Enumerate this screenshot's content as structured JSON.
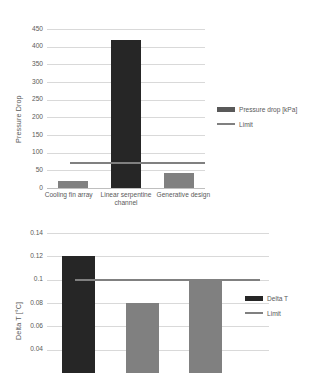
{
  "chart_data": [
    {
      "type": "bar",
      "id": "pressure-drop",
      "title": "",
      "xlabel": "",
      "ylabel": "Pressure Drop",
      "categories": [
        "Cooling fin array",
        "Linear serpentine channel",
        "Generative design"
      ],
      "series": [
        {
          "name": "Pressure drop [kPa]",
          "values": [
            20,
            420,
            42
          ],
          "colors": [
            "#808080",
            "#262626",
            "#808080"
          ]
        }
      ],
      "reference_line": {
        "name": "Limit",
        "value": 70,
        "color": "#808080"
      },
      "ylim": [
        0,
        450
      ],
      "yticks": [
        "0",
        "50",
        "100",
        "150",
        "200",
        "250",
        "300",
        "350",
        "400",
        "450"
      ],
      "ytick_values": [
        0,
        50,
        100,
        150,
        200,
        250,
        300,
        350,
        400,
        450
      ],
      "grid": true,
      "legend_position": "right",
      "legend": [
        {
          "label": "Pressure drop [kPa]",
          "marker": "bar",
          "color": "#595959"
        },
        {
          "label": "Limit",
          "marker": "line",
          "color": "#808080"
        }
      ]
    },
    {
      "type": "bar",
      "id": "delta-t",
      "title": "",
      "xlabel": "",
      "ylabel": "Delta T [°C]",
      "categories": [
        "Cooling fin array",
        "Linear serpentine channel",
        "Generative design"
      ],
      "series": [
        {
          "name": "Delta T",
          "values": [
            0.12,
            0.08,
            0.1
          ],
          "colors": [
            "#262626",
            "#808080",
            "#808080"
          ]
        }
      ],
      "reference_line": {
        "name": "Limit",
        "value": 0.1,
        "color": "#808080"
      },
      "ylim": [
        0.02,
        0.14
      ],
      "yticks": [
        "0.14",
        "0.12",
        "0.1",
        "0.08",
        "0.06",
        "0.04"
      ],
      "ytick_values": [
        0.14,
        0.12,
        0.1,
        0.08,
        0.06,
        0.04
      ],
      "grid": true,
      "cropped": true,
      "legend_position": "right",
      "legend": [
        {
          "label": "Delta T",
          "marker": "bar",
          "color": "#262626"
        },
        {
          "label": "Limit",
          "marker": "line",
          "color": "#808080"
        }
      ]
    }
  ]
}
